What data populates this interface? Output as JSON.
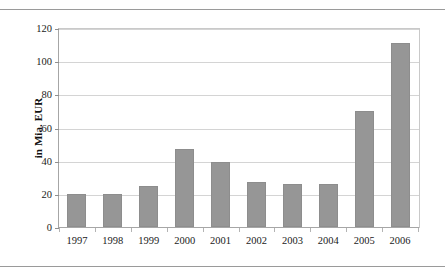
{
  "page": {
    "ghost_top": ". .   .    . .     .      .  .",
    "ghost_bottom": ".  . .    ..   .  .    . .   ."
  },
  "chart_data": {
    "type": "bar",
    "title": "",
    "subtitle": "",
    "xlabel": "",
    "ylabel": "in Mia. EUR",
    "categories": [
      "1997",
      "1998",
      "1999",
      "2000",
      "2001",
      "2002",
      "2003",
      "2004",
      "2005",
      "2006"
    ],
    "values": [
      20,
      20,
      25,
      47,
      39,
      27,
      26,
      26,
      70,
      111
    ],
    "series": [
      {
        "name": "in Mia. EUR",
        "values": [
          20,
          20,
          25,
          47,
          39,
          27,
          26,
          26,
          70,
          111
        ]
      }
    ],
    "ylim": [
      0,
      120
    ],
    "yticks": [
      0,
      20,
      40,
      60,
      80,
      100,
      120
    ],
    "ytick_labels": [
      "0",
      "20",
      "40",
      "60",
      "80",
      "100",
      "120"
    ],
    "xlim_categories": 10,
    "grid": true,
    "grid_axis": "y",
    "legend": false,
    "legend_position": "none",
    "bar_color": "#969696",
    "bar_border_color": "#8d8d8d",
    "grid_color": "#d4d4d4",
    "axis_color": "#a6a6a6",
    "background": "#ffffff"
  }
}
